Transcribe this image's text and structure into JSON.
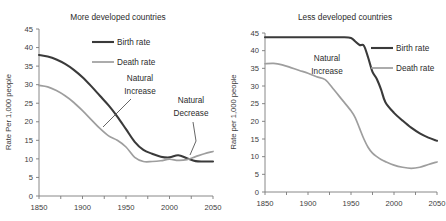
{
  "figure": {
    "background": "#ffffff",
    "width": 446,
    "height": 221
  },
  "colors": {
    "birth_rate": "#3a3a3a",
    "death_rate": "#9e9e9e",
    "axis": "#7a7a7a",
    "text": "#2b2b2b"
  },
  "panels": [
    {
      "id": "more-developed",
      "title": "More developed countries",
      "ylabel": "Rate Per 1,000 people",
      "legend": {
        "position": "top-center",
        "entries": [
          {
            "label": "Birth rate",
            "series": "birth_rate"
          },
          {
            "label": "Death rate",
            "series": "death_rate"
          }
        ]
      },
      "annotations": [
        {
          "name": "natural-increase",
          "lines": [
            "Natural",
            "Increase"
          ]
        },
        {
          "name": "natural-decrease",
          "lines": [
            "Natural",
            "Decrease"
          ]
        }
      ]
    },
    {
      "id": "less-developed",
      "title": "Less developed countries",
      "ylabel": "Rate per 1,000 people",
      "legend": {
        "position": "top-right",
        "entries": [
          {
            "label": "Birth rate",
            "series": "birth_rate"
          },
          {
            "label": "Death rate",
            "series": "death_rate"
          }
        ]
      },
      "annotations": [
        {
          "name": "natural-increase",
          "lines": [
            "Natural",
            "Increase"
          ]
        }
      ]
    }
  ],
  "chart_data": [
    {
      "type": "line",
      "id": "more-developed",
      "title": "More developed countries",
      "xlabel": "",
      "ylabel": "Rate Per 1,000 people",
      "xlim": [
        1850,
        2050
      ],
      "ylim": [
        0,
        45
      ],
      "xticks": [
        1850,
        1900,
        1950,
        2000,
        2050
      ],
      "xticks_minor": [
        1875,
        1925,
        1975,
        2025
      ],
      "yticks": [
        0,
        5,
        10,
        15,
        20,
        25,
        30,
        35,
        40,
        45
      ],
      "grid": false,
      "legend": "top-center",
      "annotations": [
        {
          "text": "Natural Increase",
          "x": 1948,
          "y": 30
        },
        {
          "text": "Natural Decrease",
          "x": 2022,
          "y": 22
        }
      ],
      "x": [
        1850,
        1860,
        1870,
        1880,
        1890,
        1900,
        1910,
        1920,
        1930,
        1940,
        1950,
        1960,
        1970,
        1980,
        1990,
        2000,
        2010,
        2020,
        2030,
        2040,
        2050
      ],
      "series": [
        {
          "name": "Birth rate",
          "color": "#3a3a3a",
          "values": [
            38.0,
            37.6,
            36.8,
            35.6,
            34.0,
            32.0,
            29.6,
            27.0,
            24.4,
            21.4,
            18.0,
            14.6,
            12.4,
            11.4,
            10.6,
            10.4,
            11.0,
            10.2,
            9.4,
            9.3,
            9.3
          ]
        },
        {
          "name": "Death rate",
          "color": "#9e9e9e",
          "values": [
            29.8,
            29.4,
            28.4,
            27.0,
            25.2,
            23.0,
            20.6,
            18.2,
            16.2,
            15.0,
            13.2,
            10.4,
            9.3,
            9.3,
            9.5,
            9.9,
            9.6,
            9.8,
            10.6,
            11.4,
            12.0
          ]
        }
      ]
    },
    {
      "type": "line",
      "id": "less-developed",
      "title": "Less developed countries",
      "xlabel": "",
      "ylabel": "Rate per 1,000 people",
      "xlim": [
        1850,
        2050
      ],
      "ylim": [
        0,
        45
      ],
      "xticks": [
        1850,
        1900,
        1950,
        2000,
        2050
      ],
      "xticks_minor": [
        1875,
        1925,
        1975,
        2025
      ],
      "yticks": [
        0,
        5,
        10,
        15,
        20,
        25,
        30,
        35,
        40,
        45
      ],
      "grid": false,
      "legend": "top-right",
      "annotations": [
        {
          "text": "Natural Increase",
          "x": 1925,
          "y": 39
        }
      ],
      "x": [
        1850,
        1860,
        1870,
        1880,
        1890,
        1900,
        1910,
        1920,
        1930,
        1940,
        1950,
        1955,
        1960,
        1965,
        1970,
        1975,
        1980,
        1985,
        1990,
        2000,
        2010,
        2020,
        2030,
        2040,
        2050
      ],
      "series": [
        {
          "name": "Birth rate",
          "color": "#3a3a3a",
          "values": [
            43.8,
            43.8,
            43.8,
            43.8,
            43.8,
            43.8,
            43.8,
            43.8,
            43.8,
            43.8,
            43.6,
            42.6,
            41.6,
            41.4,
            38.0,
            34.0,
            32.0,
            29.0,
            25.4,
            22.4,
            20.2,
            18.2,
            16.6,
            15.4,
            14.5
          ]
        },
        {
          "name": "Death rate",
          "color": "#9e9e9e",
          "values": [
            36.3,
            36.4,
            36.0,
            35.2,
            34.4,
            33.6,
            32.6,
            31.8,
            29.0,
            26.0,
            23.0,
            21.0,
            18.0,
            15.0,
            12.6,
            11.0,
            10.0,
            9.2,
            8.6,
            7.6,
            7.0,
            6.7,
            7.0,
            7.8,
            8.5
          ]
        }
      ]
    }
  ]
}
